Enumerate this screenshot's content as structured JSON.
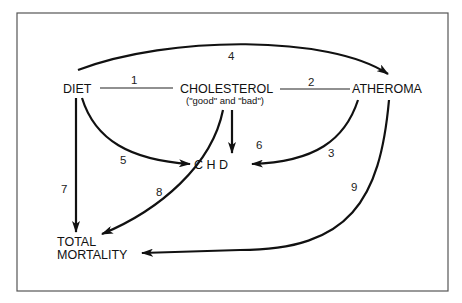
{
  "nodes": {
    "diet": {
      "label": "DIET"
    },
    "cholesterol": {
      "label": "CHOLESTEROL",
      "sublabel": "(\"good\" and \"bad\")"
    },
    "atheroma": {
      "label": "ATHEROMA"
    },
    "chd": {
      "label": "C H D"
    },
    "total_mortality": {
      "line1": "TOTAL",
      "line2": "MORTALITY"
    }
  },
  "edges": [
    {
      "id": "1",
      "from": "DIET",
      "to": "CHOLESTEROL",
      "style": "line",
      "label": "1"
    },
    {
      "id": "2",
      "from": "CHOLESTEROL",
      "to": "ATHEROMA",
      "style": "line",
      "label": "2"
    },
    {
      "id": "3",
      "from": "ATHEROMA",
      "to": "C H D",
      "style": "arrow",
      "label": "3"
    },
    {
      "id": "4",
      "from": "DIET",
      "to": "ATHEROMA",
      "style": "arrow",
      "label": "4"
    },
    {
      "id": "5",
      "from": "DIET",
      "to": "C H D",
      "style": "arrow",
      "label": "5"
    },
    {
      "id": "6",
      "from": "CHOLESTEROL",
      "to": "C H D",
      "style": "arrow",
      "label": "6"
    },
    {
      "id": "7",
      "from": "DIET",
      "to": "TOTAL MORTALITY",
      "style": "arrow",
      "label": "7"
    },
    {
      "id": "8",
      "from": "CHOLESTEROL",
      "to": "TOTAL MORTALITY",
      "style": "arrow",
      "label": "8"
    },
    {
      "id": "9",
      "from": "ATHEROMA",
      "to": "TOTAL MORTALITY",
      "style": "arrow",
      "label": "9"
    }
  ],
  "colors": {
    "ink": "#111111",
    "frame": "#555555",
    "background": "#ffffff"
  }
}
